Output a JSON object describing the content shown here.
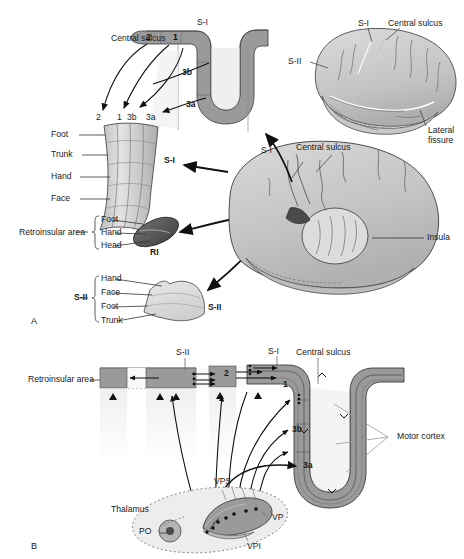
{
  "figure": {
    "panels": [
      {
        "id": "A",
        "label": "A"
      },
      {
        "id": "B",
        "label": "B"
      }
    ]
  },
  "colors": {
    "cortex_ribbon": "#9a9a9a",
    "cortex_ribbon_dark": "#7d7d7d",
    "ri_region": "#5a5a5a",
    "sii_region": "#dcdcdc",
    "brain_fill": "#cfcfcf",
    "brain_fill_light": "#dedede",
    "thalamus_fill": "#e2e2e2",
    "vp_fill": "#9a9a9a",
    "po_fill": "#b5b5b5",
    "line": "#111111",
    "leader": "#333333",
    "text": "#1a1a1a"
  },
  "panel_a": {
    "cortical_section": {
      "title_si": "S-I",
      "central_sulcus": "Central sulcus",
      "areas": [
        "2",
        "1",
        "3b",
        "3a"
      ],
      "area_labels_on_section": [
        {
          "name": "2",
          "x": 148,
          "y": 43
        },
        {
          "name": "1",
          "x": 175,
          "y": 42
        },
        {
          "name": "3b",
          "x": 185,
          "y": 74
        },
        {
          "name": "3a",
          "x": 188,
          "y": 104
        }
      ],
      "area_labels_below": [
        {
          "name": "2",
          "x": 98,
          "y": 118
        },
        {
          "name": "1",
          "x": 119,
          "y": 118
        },
        {
          "name": "3b",
          "x": 131,
          "y": 118
        },
        {
          "name": "3a",
          "x": 152,
          "y": 118
        }
      ]
    },
    "si_strip": {
      "label": "S-I",
      "body_parts": [
        "Foot",
        "Trunk",
        "Hand",
        "Face"
      ]
    },
    "retroinsular": {
      "bracket_label": "Retroinsular area",
      "body_parts": [
        "Foot",
        "Hand",
        "Head"
      ],
      "region_label": "RI"
    },
    "sii_map": {
      "bracket_label": "S-II",
      "body_parts": [
        "Hand",
        "Face",
        "Foot",
        "Trunk"
      ],
      "region_label": "S-II"
    },
    "lateral_brain": {
      "si": "S-I",
      "sii": "S-II",
      "central_sulcus": "Central sulcus",
      "lateral_fissure_line1": "Lateral",
      "lateral_fissure_line2": "fissure"
    },
    "big_brain": {
      "si": "S-I",
      "central_sulcus": "Central sulcus",
      "insula": "Insula"
    }
  },
  "panel_b": {
    "retroinsular_area": "Retroinsular area",
    "sii": "S-II",
    "si": "S-I",
    "central_sulcus": "Central sulcus",
    "motor_cortex": "Motor cortex",
    "cortical_areas": [
      {
        "name": "2",
        "x": 226,
        "y": 374
      },
      {
        "name": "1",
        "x": 285,
        "y": 385
      },
      {
        "name": "3b",
        "x": 296,
        "y": 430
      },
      {
        "name": "3a",
        "x": 307,
        "y": 466
      }
    ],
    "thalamus": {
      "label": "Thalamus",
      "nuclei": [
        {
          "name": "PO",
          "x": 148,
          "y": 533
        },
        {
          "name": "VPS",
          "x": 222,
          "y": 481
        },
        {
          "name": "VP",
          "x": 272,
          "y": 517
        },
        {
          "name": "VPI",
          "x": 247,
          "y": 546
        }
      ]
    }
  }
}
